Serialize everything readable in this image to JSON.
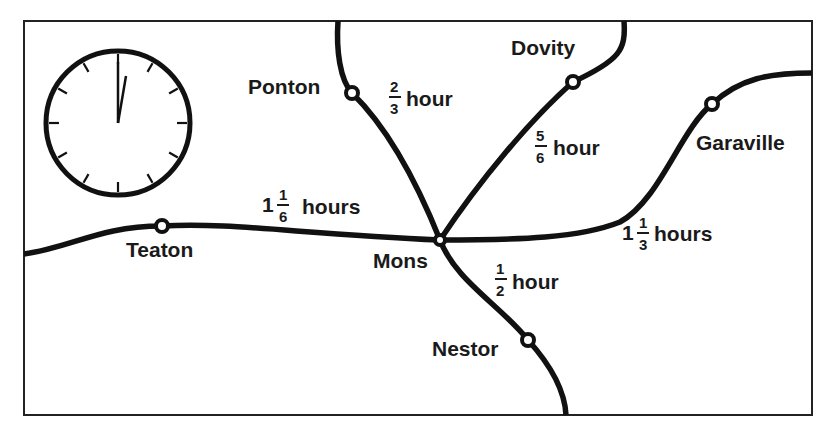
{
  "map": {
    "frame": {
      "x": 24,
      "y": 21,
      "width": 788,
      "height": 394,
      "border_color": "#222222"
    },
    "clock": {
      "center": [
        118,
        123
      ],
      "radius": 73,
      "time_shown": "12:00",
      "hour_hand_angle_deg": 8,
      "minute_hand_angle_deg": 0
    },
    "towns": [
      {
        "name": "Ponton",
        "x": 352,
        "y": 93
      },
      {
        "name": "Dovity",
        "x": 573,
        "y": 82
      },
      {
        "name": "Garaville",
        "x": 712,
        "y": 104
      },
      {
        "name": "Teaton",
        "x": 162,
        "y": 227
      },
      {
        "name": "Mons",
        "x": 440,
        "y": 241
      },
      {
        "name": "Nestor",
        "x": 528,
        "y": 340
      }
    ],
    "labels": {
      "ponton": "Ponton",
      "dovity": "Dovity",
      "garaville": "Garaville",
      "teaton": "Teaton",
      "mons": "Mons",
      "nestor": "Nestor"
    },
    "travel_times": {
      "ponton_mons": {
        "whole": "",
        "num": "2",
        "den": "3",
        "unit": "hour"
      },
      "dovity_mons": {
        "whole": "",
        "num": "5",
        "den": "6",
        "unit": "hour"
      },
      "teaton_mons": {
        "whole": "1",
        "num": "1",
        "den": "6",
        "unit": "hours"
      },
      "mons_garaville": {
        "whole": "1",
        "num": "1",
        "den": "3",
        "unit": "hours"
      },
      "mons_nestor": {
        "whole": "",
        "num": "1",
        "den": "2",
        "unit": "hour"
      }
    },
    "colors": {
      "road": "#111111",
      "text": "#1a1a1a",
      "background": "#ffffff"
    }
  }
}
